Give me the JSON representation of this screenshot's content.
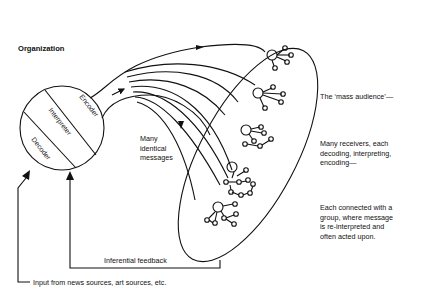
{
  "diagram": {
    "type": "mass communication model",
    "title": "Organization",
    "organization_circle": {
      "segments": [
        "Encoder",
        "Interpreter",
        "Decoder"
      ]
    },
    "messages_label": [
      "Many",
      "identical",
      "messages"
    ],
    "right_annotations": [
      {
        "lines": [
          "The ‘mass audience’—"
        ]
      },
      {
        "lines": [
          "Many receivers, each",
          "decoding, interpreting,",
          "encoding—"
        ]
      },
      {
        "lines": [
          "Each connected with a",
          "group, where message",
          "is re-interpreted and",
          "often acted upon."
        ]
      }
    ],
    "feedback_label": "Inferential feedback",
    "input_label": "Input from news sources, art sources, etc.",
    "stroke_color": "#111111",
    "background_color": "#ffffff"
  }
}
